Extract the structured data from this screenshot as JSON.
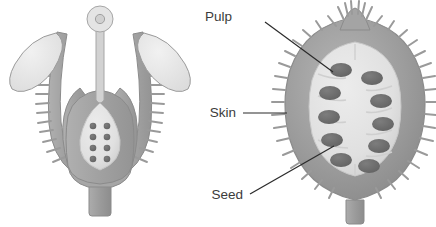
{
  "figure": {
    "background_color": "#ffffff"
  },
  "colors": {
    "outline": "#8e8e8e",
    "skin": "#9a9a9a",
    "skin_dark": "#8a8a8a",
    "skin_light": "#b4b4b4",
    "pulp": "#e3e3e3",
    "pulp_shadow": "#d2d2d2",
    "seed": "#6e6e6e",
    "seed_dark": "#5f5f5f",
    "petal": "#e8e8e8",
    "ovary_wall": "#a8a8a8",
    "stem": "#9f9f9f",
    "leader_line": "#2b2b2b",
    "label_text": "#3b3b3b"
  },
  "left_diagram": {
    "name": "flower-ovary-longitudinal-section",
    "parts": {
      "stigma": "stigma",
      "style": "style",
      "petal_left": "petal-left",
      "petal_right": "petal-right",
      "sepal_left": "spiny-sepal-left",
      "sepal_right": "spiny-sepal-right",
      "ovary": "ovary",
      "stalk": "stalk"
    },
    "ovules": {
      "count": 8,
      "rows": 4,
      "columns": 2,
      "shape": "round"
    }
  },
  "right_diagram": {
    "name": "fruit-longitudinal-section",
    "parts": {
      "crown": "persistent-calyx-crown",
      "skin": "skin",
      "pulp": "pulp",
      "stalk": "stalk"
    },
    "seeds": {
      "count": 10,
      "rows": 5,
      "columns": 2,
      "shape": "oval"
    }
  },
  "labels": [
    {
      "id": "pulp",
      "text": "Pulp",
      "text_x": 232,
      "text_y": 21,
      "leader": {
        "x1": 265,
        "y1": 22,
        "x2": 333,
        "y2": 72
      }
    },
    {
      "id": "skin",
      "text": "Skin",
      "text_x": 207,
      "text_y": 117,
      "leader": {
        "x1": 243,
        "y1": 113,
        "x2": 287,
        "y2": 113
      }
    },
    {
      "id": "seed",
      "text": "Seed",
      "text_x": 207,
      "text_y": 199,
      "leader": {
        "x1": 250,
        "y1": 194,
        "x2": 334,
        "y2": 146
      }
    }
  ]
}
